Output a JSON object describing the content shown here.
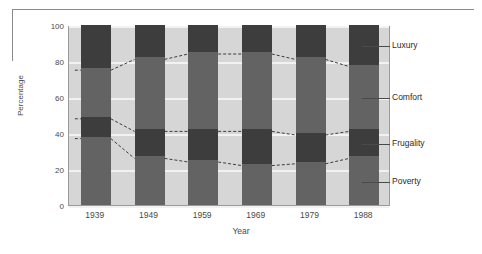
{
  "chart_data": {
    "type": "area",
    "title": "",
    "xlabel": "Year",
    "ylabel": "Percentage",
    "categories": [
      "1939",
      "1949",
      "1959",
      "1969",
      "1979",
      "1988"
    ],
    "ylim": [
      0,
      100
    ],
    "yticks": [
      0,
      20,
      40,
      60,
      80,
      100
    ],
    "grid": true,
    "legend_position": "right-callouts",
    "stacked": true,
    "series": [
      {
        "name": "Poverty",
        "color": "#636363",
        "values": [
          38,
          27,
          25,
          23,
          24,
          27
        ]
      },
      {
        "name": "Frugality",
        "color": "#3d3d3d",
        "values": [
          11,
          15,
          17,
          19,
          16,
          15
        ]
      },
      {
        "name": "Comfort",
        "color": "#636363",
        "values": [
          27,
          40,
          43,
          43,
          42,
          36
        ]
      },
      {
        "name": "Luxury",
        "color": "#3d3d3d",
        "values": [
          24,
          18,
          15,
          15,
          18,
          22
        ]
      }
    ],
    "boundaries": {
      "poverty_top": [
        38,
        27,
        25,
        23,
        24,
        27
      ],
      "frugality_top": [
        49,
        42,
        42,
        42,
        40,
        42
      ],
      "comfort_top": [
        76,
        82,
        85,
        85,
        82,
        78
      ],
      "luxury_top": [
        100,
        100,
        100,
        100,
        100,
        100
      ]
    }
  },
  "axes": {
    "y_title": "Percentage",
    "x_title": "Year",
    "y_tick_labels": [
      "100",
      "80",
      "60",
      "40",
      "20",
      "0"
    ],
    "x_tick_labels": [
      "1939",
      "1949",
      "1959",
      "1969",
      "1979",
      "1988"
    ]
  },
  "legend": {
    "items": [
      {
        "label": "Luxury"
      },
      {
        "label": "Comfort"
      },
      {
        "label": "Frugality"
      },
      {
        "label": "Poverty"
      }
    ]
  },
  "colors": {
    "dark_band": "#3d3d3d",
    "mid_band": "#636363",
    "plot_background": "#d6d6d6",
    "gridline": "#f2f2f2",
    "page_background": "#ffffff"
  }
}
